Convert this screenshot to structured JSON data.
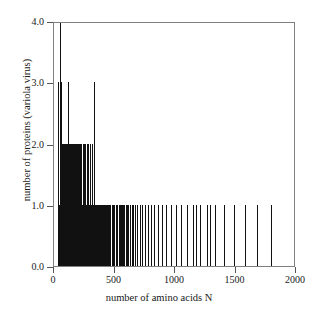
{
  "chart_data": {
    "type": "bar",
    "title": "",
    "xlabel": "number of amino acids N",
    "ylabel": "number of proteins (variola virus)",
    "xlim": [
      0,
      2000
    ],
    "ylim": [
      0,
      4.0
    ],
    "xticks": [
      0,
      500,
      1000,
      1500,
      2000
    ],
    "xtick_labels": [
      "0",
      "500",
      "1000",
      "1500",
      "2000"
    ],
    "yticks": [
      0.0,
      1.0,
      2.0,
      3.0,
      4.0
    ],
    "ytick_labels": [
      "0.0",
      "1.0",
      "2.0",
      "3.0",
      "4.0"
    ],
    "grid": false,
    "legend": null,
    "bar_color": "#111111",
    "frame_color": "#808080",
    "x": [
      31,
      42,
      53,
      60,
      62,
      65,
      68,
      72,
      75,
      77,
      79,
      82,
      85,
      88,
      90,
      92,
      95,
      97,
      99,
      101,
      104,
      106,
      108,
      110,
      112,
      114,
      116,
      118,
      120,
      122,
      124,
      126,
      128,
      130,
      132,
      134,
      136,
      138,
      140,
      142,
      144,
      146,
      148,
      150,
      152,
      154,
      156,
      158,
      160,
      162,
      164,
      166,
      168,
      170,
      172,
      174,
      176,
      178,
      180,
      182,
      184,
      186,
      188,
      190,
      192,
      194,
      196,
      198,
      200,
      203,
      205,
      207,
      209,
      211,
      213,
      215,
      217,
      219,
      221,
      223,
      225,
      227,
      229,
      231,
      233,
      235,
      237,
      239,
      241,
      243,
      245,
      247,
      249,
      251,
      253,
      255,
      257,
      259,
      261,
      263,
      265,
      267,
      269,
      271,
      273,
      275,
      277,
      279,
      281,
      283,
      285,
      288,
      290,
      292,
      294,
      296,
      298,
      300,
      303,
      305,
      307,
      309,
      311,
      314,
      316,
      318,
      321,
      323,
      326,
      328,
      331,
      333,
      336,
      338,
      341,
      344,
      347,
      350,
      353,
      356,
      359,
      362,
      366,
      370,
      374,
      378,
      383,
      388,
      393,
      399,
      405,
      411,
      418,
      425,
      432,
      440,
      448,
      457,
      466,
      476,
      486,
      497,
      509,
      521,
      534,
      548,
      555,
      563,
      572,
      581,
      591,
      602,
      614,
      627,
      641,
      656,
      672,
      690,
      709,
      730,
      752,
      776,
      802,
      830,
      860,
      892,
      927,
      965,
      1006,
      1050,
      1098,
      1150,
      1170,
      1206,
      1267,
      1290,
      1334,
      1408,
      1490,
      1580,
      1680,
      1790,
      1900
    ],
    "y": [
      3,
      1,
      4,
      3,
      2,
      2,
      2,
      2,
      2,
      1,
      2,
      2,
      2,
      1,
      2,
      1,
      2,
      1,
      2,
      1,
      2,
      1,
      2,
      2,
      1,
      2,
      3,
      2,
      1,
      2,
      1,
      1,
      2,
      2,
      1,
      2,
      1,
      2,
      1,
      1,
      2,
      1,
      2,
      1,
      2,
      1,
      1,
      2,
      1,
      2,
      1,
      1,
      2,
      1,
      1,
      2,
      1,
      2,
      1,
      1,
      2,
      1,
      1,
      2,
      1,
      1,
      2,
      1,
      1,
      2,
      1,
      1,
      1,
      2,
      1,
      1,
      1,
      2,
      1,
      1,
      1,
      2,
      1,
      1,
      1,
      1,
      2,
      1,
      1,
      1,
      1,
      2,
      1,
      1,
      1,
      1,
      1,
      2,
      1,
      1,
      1,
      1,
      1,
      2,
      1,
      1,
      1,
      1,
      1,
      1,
      2,
      1,
      1,
      1,
      1,
      1,
      1,
      2,
      1,
      1,
      1,
      1,
      1,
      1,
      1,
      2,
      1,
      1,
      1,
      1,
      1,
      3,
      1,
      1,
      1,
      1,
      1,
      1,
      1,
      1,
      1,
      1,
      1,
      1,
      1,
      1,
      1,
      1,
      1,
      1,
      1,
      1,
      1,
      1,
      1,
      1,
      1,
      1,
      1,
      1,
      1,
      1,
      1,
      1,
      1,
      1,
      1,
      1,
      1,
      1,
      1,
      1,
      1,
      1,
      1,
      1,
      1,
      1,
      1,
      1,
      1,
      1,
      1,
      1,
      1,
      1,
      1,
      1,
      1,
      1,
      1,
      1,
      1,
      1,
      1,
      1,
      1,
      1,
      1,
      1,
      1,
      1
    ]
  }
}
